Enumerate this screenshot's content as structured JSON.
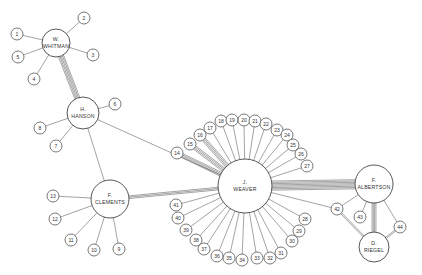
{
  "diagram": {
    "type": "sociogram",
    "colors": {
      "line": "#666666",
      "background": "#ffffff",
      "text": "#333333"
    },
    "hubs": [
      {
        "id": "whitman",
        "initial": "W.",
        "name": "WHITMAN",
        "x": 56,
        "y": 43,
        "r": 14
      },
      {
        "id": "hanson",
        "initial": "H.",
        "name": "HANSON",
        "x": 83,
        "y": 113,
        "r": 16
      },
      {
        "id": "clements",
        "initial": "F.",
        "name": "CLEMENTS",
        "x": 110,
        "y": 199,
        "r": 19
      },
      {
        "id": "weaver",
        "initial": "J.",
        "name": "WEAVER",
        "x": 245,
        "y": 186,
        "r": 27
      },
      {
        "id": "albertson",
        "initial": "F.",
        "name": "ALBERTSON",
        "x": 374,
        "y": 184,
        "r": 19
      },
      {
        "id": "riegel",
        "initial": "D.",
        "name": "RIEGEL",
        "x": 374,
        "y": 247,
        "r": 15
      }
    ],
    "nodes": [
      {
        "label": "1",
        "x": 17,
        "y": 34,
        "hub": "whitman"
      },
      {
        "label": "2",
        "x": 84,
        "y": 18,
        "hub": "whitman"
      },
      {
        "label": "3",
        "x": 93,
        "y": 55,
        "hub": "whitman"
      },
      {
        "label": "4",
        "x": 34,
        "y": 79,
        "hub": "whitman"
      },
      {
        "label": "5",
        "x": 18,
        "y": 57,
        "hub": "whitman"
      },
      {
        "label": "6",
        "x": 115,
        "y": 104,
        "hub": "hanson"
      },
      {
        "label": "7",
        "x": 56,
        "y": 146,
        "hub": "hanson"
      },
      {
        "label": "8",
        "x": 40,
        "y": 128,
        "hub": "hanson"
      },
      {
        "label": "9",
        "x": 119,
        "y": 249,
        "hub": "clements"
      },
      {
        "label": "10",
        "x": 94,
        "y": 250,
        "hub": "clements"
      },
      {
        "label": "11",
        "x": 71,
        "y": 240,
        "hub": "clements"
      },
      {
        "label": "12",
        "x": 55,
        "y": 219,
        "hub": "clements"
      },
      {
        "label": "13",
        "x": 53,
        "y": 196,
        "hub": "clements"
      },
      {
        "label": "14",
        "x": 177,
        "y": 153,
        "hub": "weaver"
      },
      {
        "label": "15",
        "x": 190,
        "y": 144,
        "hub": "weaver"
      },
      {
        "label": "16",
        "x": 200,
        "y": 135,
        "hub": "weaver"
      },
      {
        "label": "17",
        "x": 210,
        "y": 128,
        "hub": "weaver"
      },
      {
        "label": "18",
        "x": 221,
        "y": 121,
        "hub": "weaver"
      },
      {
        "label": "19",
        "x": 232,
        "y": 120,
        "hub": "weaver"
      },
      {
        "label": "20",
        "x": 244,
        "y": 120,
        "hub": "weaver"
      },
      {
        "label": "21",
        "x": 255,
        "y": 121,
        "hub": "weaver"
      },
      {
        "label": "22",
        "x": 266,
        "y": 124,
        "hub": "weaver"
      },
      {
        "label": "23",
        "x": 277,
        "y": 130,
        "hub": "weaver"
      },
      {
        "label": "24",
        "x": 287,
        "y": 135,
        "hub": "weaver"
      },
      {
        "label": "25",
        "x": 293,
        "y": 145,
        "hub": "weaver"
      },
      {
        "label": "26",
        "x": 301,
        "y": 154,
        "hub": "weaver"
      },
      {
        "label": "27",
        "x": 307,
        "y": 166,
        "hub": "weaver"
      },
      {
        "label": "28",
        "x": 305,
        "y": 219,
        "hub": "weaver"
      },
      {
        "label": "29",
        "x": 299,
        "y": 231,
        "hub": "weaver"
      },
      {
        "label": "30",
        "x": 292,
        "y": 241,
        "hub": "weaver"
      },
      {
        "label": "31",
        "x": 281,
        "y": 253,
        "hub": "weaver"
      },
      {
        "label": "32",
        "x": 270,
        "y": 258,
        "hub": "weaver"
      },
      {
        "label": "33",
        "x": 257,
        "y": 258,
        "hub": "weaver"
      },
      {
        "label": "34",
        "x": 242,
        "y": 260,
        "hub": "weaver"
      },
      {
        "label": "35",
        "x": 229,
        "y": 258,
        "hub": "weaver"
      },
      {
        "label": "36",
        "x": 217,
        "y": 256,
        "hub": "weaver"
      },
      {
        "label": "37",
        "x": 204,
        "y": 249,
        "hub": "weaver"
      },
      {
        "label": "38",
        "x": 196,
        "y": 240,
        "hub": "weaver"
      },
      {
        "label": "39",
        "x": 186,
        "y": 230,
        "hub": "weaver"
      },
      {
        "label": "40",
        "x": 178,
        "y": 218,
        "hub": "weaver"
      },
      {
        "label": "41",
        "x": 176,
        "y": 205,
        "hub": "weaver"
      },
      {
        "label": "42",
        "x": 337,
        "y": 209,
        "hub": "albertson"
      },
      {
        "label": "43",
        "x": 360,
        "y": 217,
        "hub": "albertson"
      },
      {
        "label": "44",
        "x": 400,
        "y": 227,
        "hub": "albertson"
      }
    ],
    "hub_links": [
      {
        "from": "whitman",
        "to": "hanson",
        "count": 5
      },
      {
        "from": "hanson",
        "to": "clements",
        "count": 1
      },
      {
        "from": "hanson",
        "to": "weaver",
        "count": 1
      },
      {
        "from": "clements",
        "to": "weaver",
        "count": 3
      },
      {
        "from": "weaver",
        "to": "albertson",
        "count": 8
      },
      {
        "from": "albertson",
        "to": "riegel",
        "count": 4
      },
      {
        "from": "weaver",
        "to": "node42",
        "count": 1
      }
    ]
  }
}
